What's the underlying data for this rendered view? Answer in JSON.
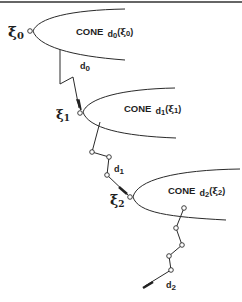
{
  "diagram": {
    "type": "descent-direction-cones",
    "border_top": true,
    "points": [
      {
        "id": "xi0",
        "symbol": "ξ",
        "subscript": "0"
      },
      {
        "id": "xi1",
        "symbol": "ξ",
        "subscript": "1"
      },
      {
        "id": "xi2",
        "symbol": "ξ",
        "subscript": "2"
      }
    ],
    "cones": [
      {
        "id": "cone0",
        "word": "CONE",
        "dir": "d",
        "dir_sub": "0",
        "open": "(",
        "arg": "ξ",
        "arg_sub": "0",
        "close": ")"
      },
      {
        "id": "cone1",
        "word": "CONE",
        "dir": "d",
        "dir_sub": "1",
        "open": "(",
        "arg": "ξ",
        "arg_sub": "1",
        "close": ")"
      },
      {
        "id": "cone2",
        "word": "CONE",
        "dir": "d",
        "dir_sub": "2",
        "open": "(",
        "arg": "ξ",
        "arg_sub": "2",
        "close": ")"
      }
    ],
    "directions": [
      {
        "id": "d0",
        "symbol": "d",
        "subscript": "0"
      },
      {
        "id": "d1",
        "symbol": "d",
        "subscript": "1"
      },
      {
        "id": "d2",
        "symbol": "d",
        "subscript": "2"
      }
    ],
    "colors": {
      "ink": "#2a2a2a",
      "background": "#ffffff"
    }
  }
}
